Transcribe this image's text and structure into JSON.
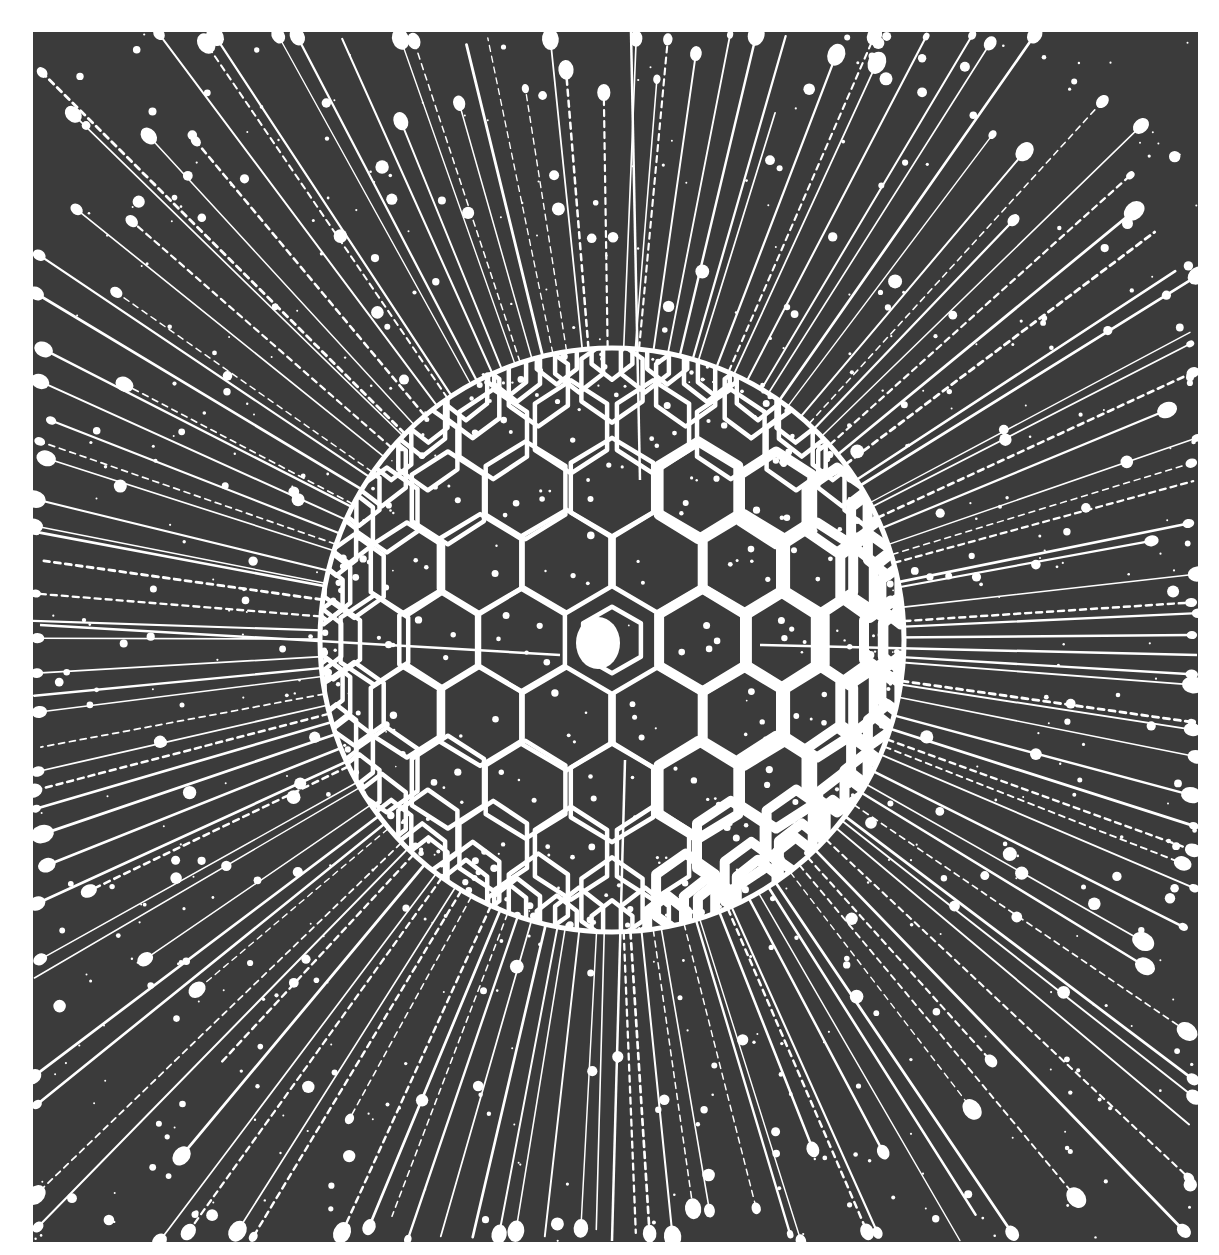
{
  "image": {
    "subject": "radiolarian-like sphere with hexagonal lattice and radiating spines",
    "style": "high-contrast black and white illustration",
    "canvas": {
      "width": 1219,
      "height": 1255,
      "background": "#ffffff"
    },
    "panel": {
      "x": 33,
      "y": 32,
      "width": 1165,
      "height": 1210,
      "color": "#3b3b3b"
    },
    "ink_color": "#ffffff",
    "sphere": {
      "cx": 612,
      "cy": 640,
      "r": 292,
      "rim_width": 5
    },
    "lattice": {
      "cell_radius": 34,
      "wall_width": 4.5,
      "bold_side": "right",
      "bold_wall_width": 10
    },
    "nucleus": {
      "cx": 598,
      "cy": 643,
      "rx": 22,
      "ry": 26
    },
    "spines": {
      "count": 150,
      "min_len": 260,
      "max_len": 620,
      "bulb_min": 3,
      "bulb_max": 9,
      "width": 2.2
    },
    "long_axis_spines": [
      {
        "x1": 631,
        "y1": 32,
        "x2": 640,
        "y2": 480
      },
      {
        "x1": 40,
        "y1": 625,
        "x2": 560,
        "y2": 655
      },
      {
        "x1": 760,
        "y1": 645,
        "x2": 1197,
        "y2": 655
      },
      {
        "x1": 625,
        "y1": 760,
        "x2": 612,
        "y2": 1241
      }
    ],
    "speckles": {
      "count": 650,
      "min_r": 1,
      "max_r": 7
    },
    "seed": 42
  }
}
